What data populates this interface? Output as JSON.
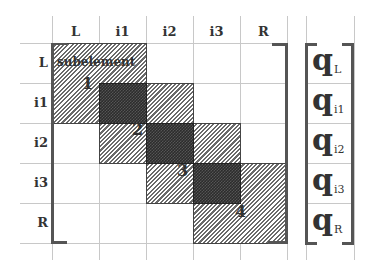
{
  "diagram": {
    "column_headers": [
      "L",
      "i1",
      "i2",
      "i3",
      "R"
    ],
    "row_labels": [
      "L",
      "i1",
      "i2",
      "i3",
      "R"
    ],
    "subelement_label": "subelement",
    "subelement_numbers": [
      "1",
      "2",
      "3",
      "4"
    ],
    "vector_symbol": "q",
    "vector_subscripts": [
      "L",
      "i1",
      "i2",
      "i3",
      "R"
    ],
    "colors": {
      "gridline": "#c8c8c8",
      "bracket": "#555555",
      "hatch": "#6a6a6a",
      "overlap": "#2c2c2c",
      "text": "#333333"
    }
  }
}
